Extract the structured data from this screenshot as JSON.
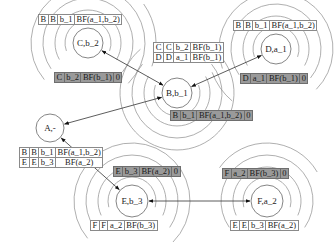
{
  "nodes": [
    {
      "id": "C",
      "label": "C,b_2"
    },
    {
      "id": "B",
      "label": "B,b_1"
    },
    {
      "id": "D",
      "label": "D,a_1"
    },
    {
      "id": "A",
      "label": "A,-"
    },
    {
      "id": "E",
      "label": "E,b_3"
    },
    {
      "id": "F",
      "label": "F,a_2"
    }
  ],
  "edges": [
    {
      "from": "C",
      "to": "B",
      "directed": "both"
    },
    {
      "from": "B",
      "to": "D",
      "directed": "both"
    },
    {
      "from": "B",
      "to": "A",
      "directed": "both"
    },
    {
      "from": "A",
      "to": "E",
      "directed": "both"
    },
    {
      "from": "E",
      "to": "F",
      "directed": "both"
    }
  ],
  "tables": {
    "c_routing": [
      [
        "B",
        "B",
        "b_1",
        "BF(a_1,b_2)"
      ]
    ],
    "c_state": [
      [
        "C",
        "b_2",
        "BF(b_1)",
        "0"
      ]
    ],
    "b_routing": [
      [
        "C",
        "C",
        "b_2",
        "BF(b_1)"
      ],
      [
        "D",
        "D",
        "a_1",
        "BF(b_1)"
      ]
    ],
    "b_state": [
      [
        "B",
        "b_1",
        "BF(a_1,b_2)",
        "0"
      ]
    ],
    "d_routing": [
      [
        "B",
        "B",
        "b_1",
        "BF(a_1,b_2)"
      ]
    ],
    "d_state": [
      [
        "D",
        "a_1",
        "BF(b_1)",
        "0"
      ]
    ],
    "a_routing": [
      [
        "B",
        "B",
        "b_1",
        "BF(a_1,b_2)"
      ],
      [
        "E",
        "E",
        "b_3",
        "BF(a_2)"
      ]
    ],
    "e_state": [
      [
        "E",
        "b_3",
        "BF(a_2)",
        "0"
      ]
    ],
    "e_routing": [
      [
        "F",
        "F",
        "a_2",
        "BF(b_3)"
      ]
    ],
    "f_state": [
      [
        "F",
        "a_2",
        "BF(b_3)",
        "0"
      ]
    ],
    "f_routing": [
      [
        "E",
        "E",
        "b_3",
        "BF(a_2)"
      ]
    ]
  }
}
